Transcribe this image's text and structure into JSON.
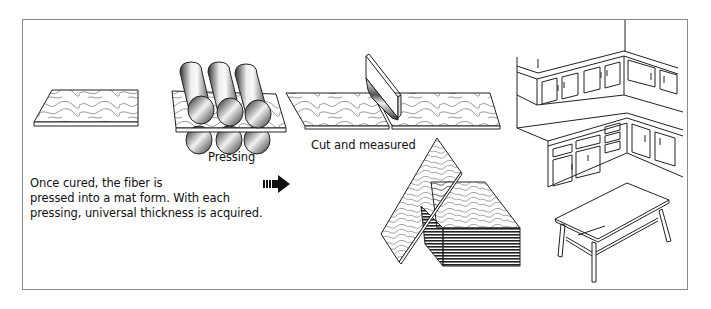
{
  "diagram": {
    "description": {
      "line1": "Once cured, the fiber is",
      "line2": "pressed into a mat form. With each",
      "line3": "pressing, universal thickness is acquired."
    },
    "steps": [
      {
        "id": "cured-mat",
        "label": ""
      },
      {
        "id": "pressing",
        "label": "Pressing"
      },
      {
        "id": "cutting",
        "label": "Cut and measured"
      },
      {
        "id": "stacked-boards",
        "label": ""
      },
      {
        "id": "products",
        "label": ""
      }
    ],
    "icons": {
      "arrow": "arrow-right-icon",
      "rollers": "roller-icon",
      "blade": "blade-icon",
      "cabinets": "kitchen-cabinets-icon",
      "table": "table-icon"
    },
    "colors": {
      "line": "#222222",
      "frame": "#8a8a8a",
      "background": "#ffffff"
    }
  }
}
